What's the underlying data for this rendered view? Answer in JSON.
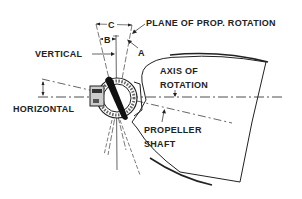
{
  "diagram": {
    "type": "technical-illustration",
    "labels": {
      "plane_of_rotation": "PLANE OF PROP. ROTATION",
      "vertical": "VERTICAL",
      "horizontal": "HORIZONTAL",
      "axis_line1": "AXIS OF",
      "axis_line2": "ROTATION",
      "shaft_line1": "PROPELLER",
      "shaft_line2": "SHAFT",
      "angle_a": "A",
      "angle_b": "B",
      "angle_c": "C"
    },
    "colors": {
      "ink": "#222222",
      "background": "#ffffff"
    }
  }
}
